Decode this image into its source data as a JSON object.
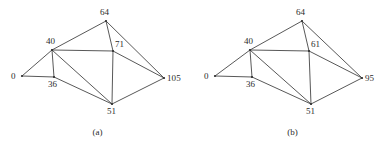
{
  "figure": {
    "background_color": "#ffffff",
    "line_color": "#3a3a3a",
    "text_color": "#2b2b2b"
  },
  "panels": [
    {
      "id": "a",
      "caption": "(a)",
      "nodes": [
        {
          "id": "n0",
          "label": "0",
          "x": 22,
          "y": 76
        },
        {
          "id": "n40",
          "label": "40",
          "x": 52,
          "y": 50
        },
        {
          "id": "n36",
          "label": "36",
          "x": 54,
          "y": 77
        },
        {
          "id": "n64",
          "label": "64",
          "x": 106,
          "y": 21
        },
        {
          "id": "n71",
          "label": "71",
          "x": 113,
          "y": 51
        },
        {
          "id": "n51",
          "label": "51",
          "x": 112,
          "y": 104
        },
        {
          "id": "n105",
          "label": "105",
          "x": 164,
          "y": 78
        }
      ],
      "edges": [
        {
          "from": "n0",
          "to": "n40"
        },
        {
          "from": "n0",
          "to": "n36"
        },
        {
          "from": "n40",
          "to": "n36"
        },
        {
          "from": "n40",
          "to": "n64"
        },
        {
          "from": "n40",
          "to": "n71"
        },
        {
          "from": "n40",
          "to": "n51"
        },
        {
          "from": "n36",
          "to": "n51"
        },
        {
          "from": "n64",
          "to": "n71"
        },
        {
          "from": "n64",
          "to": "n105"
        },
        {
          "from": "n71",
          "to": "n51"
        },
        {
          "from": "n71",
          "to": "n105"
        },
        {
          "from": "n51",
          "to": "n105"
        }
      ]
    },
    {
      "id": "b",
      "caption": "(b)",
      "nodes": [
        {
          "id": "n0",
          "label": "0",
          "x": 20,
          "y": 76
        },
        {
          "id": "n40",
          "label": "40",
          "x": 55,
          "y": 50
        },
        {
          "id": "n36",
          "label": "36",
          "x": 57,
          "y": 77
        },
        {
          "id": "n64",
          "label": "64",
          "x": 107,
          "y": 21
        },
        {
          "id": "n61",
          "label": "61",
          "x": 114,
          "y": 51
        },
        {
          "id": "n51",
          "label": "51",
          "x": 116,
          "y": 104
        },
        {
          "id": "n95",
          "label": "95",
          "x": 167,
          "y": 78
        }
      ],
      "edges": [
        {
          "from": "n0",
          "to": "n40"
        },
        {
          "from": "n0",
          "to": "n36"
        },
        {
          "from": "n40",
          "to": "n36"
        },
        {
          "from": "n40",
          "to": "n64"
        },
        {
          "from": "n40",
          "to": "n61"
        },
        {
          "from": "n40",
          "to": "n51"
        },
        {
          "from": "n36",
          "to": "n51"
        },
        {
          "from": "n64",
          "to": "n61"
        },
        {
          "from": "n64",
          "to": "n95"
        },
        {
          "from": "n61",
          "to": "n51"
        },
        {
          "from": "n61",
          "to": "n95"
        },
        {
          "from": "n51",
          "to": "n95"
        }
      ]
    }
  ],
  "label_offsets": {
    "n0": {
      "dx": -11,
      "dy": -4
    },
    "n40": {
      "dx": -6,
      "dy": -13
    },
    "n36": {
      "dx": -6,
      "dy": 3
    },
    "n64": {
      "dx": -6,
      "dy": -13
    },
    "n71": {
      "dx": 2,
      "dy": -11
    },
    "n61": {
      "dx": 2,
      "dy": -11
    },
    "n51": {
      "dx": -5,
      "dy": 3
    },
    "n105": {
      "dx": 3,
      "dy": -4
    },
    "n95": {
      "dx": 3,
      "dy": -4
    }
  }
}
